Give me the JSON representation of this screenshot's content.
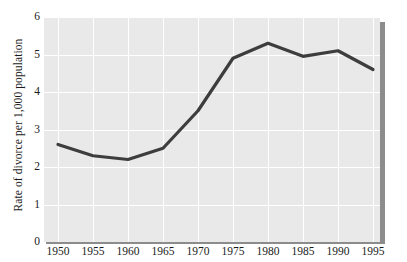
{
  "chart_data": {
    "type": "line",
    "title": "",
    "subtitle": "",
    "xlabel": "",
    "ylabel": "Rate of divorce per 1,000 population",
    "x": [
      1950,
      1955,
      1960,
      1965,
      1970,
      1975,
      1980,
      1985,
      1990,
      1995
    ],
    "values": [
      2.6,
      2.3,
      2.2,
      2.5,
      3.5,
      4.9,
      5.3,
      4.95,
      5.1,
      4.6
    ],
    "series": [
      {
        "name": "Rate of divorce per 1,000 population",
        "values": [
          2.6,
          2.3,
          2.2,
          2.5,
          3.5,
          4.9,
          5.3,
          4.95,
          5.1,
          4.6
        ]
      }
    ],
    "xlim": [
      1948,
      1996
    ],
    "ylim": [
      0,
      6
    ],
    "x_tick_labels": [
      "1950",
      "1955",
      "1960",
      "1965",
      "1970",
      "1975",
      "1980",
      "1985",
      "1990",
      "1995"
    ],
    "y_tick_labels": [
      "0",
      "1",
      "2",
      "3",
      "4",
      "5",
      "6"
    ],
    "y_ticks": [
      0,
      1,
      2,
      3,
      4,
      5,
      6
    ],
    "grid": true,
    "legend": "none",
    "annotations": [],
    "colors": {
      "line": "#3d3d3d",
      "plot_background": "#e9e9e9",
      "gridline": "#ffffff",
      "shadow": "#8c8c8c",
      "text": "#1a1a1a",
      "page_background": "#ffffff"
    }
  }
}
